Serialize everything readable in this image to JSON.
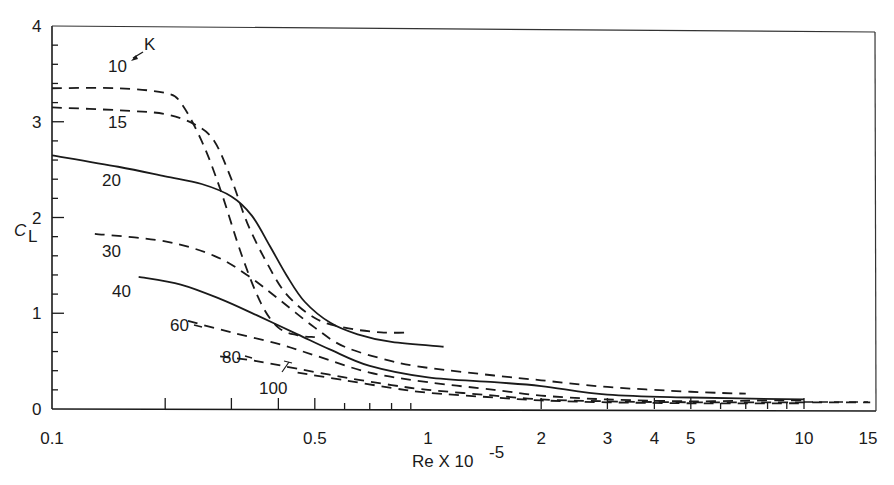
{
  "chart_data": {
    "type": "line",
    "title": "",
    "xlabel": "Re X 10",
    "xlabel_exponent": "-5",
    "ylabel": "C",
    "ylabel_subscript": "L",
    "x_scale": "log",
    "xlim": [
      0.1,
      15
    ],
    "ylim": [
      0,
      4
    ],
    "grid": false,
    "x_ticks": [
      0.1,
      0.5,
      1,
      2,
      3,
      4,
      5,
      10,
      15
    ],
    "x_tick_labels": [
      "0.1",
      "0.5",
      "1",
      "2",
      "3",
      "4",
      "5",
      "10",
      "15"
    ],
    "y_ticks": [
      0,
      1,
      2,
      3,
      4
    ],
    "y_tick_labels": [
      "0",
      "1",
      "2",
      "3",
      "4"
    ],
    "legend_title": "K",
    "series": [
      {
        "name": "10",
        "style": "dashed",
        "x": [
          0.1,
          0.15,
          0.2,
          0.22,
          0.25,
          0.28,
          0.32,
          0.36,
          0.4,
          0.45,
          0.5
        ],
        "y": [
          3.35,
          3.35,
          3.3,
          3.2,
          2.8,
          2.3,
          1.6,
          1.1,
          0.85,
          0.77,
          0.75
        ]
      },
      {
        "name": "15",
        "style": "dashed",
        "x": [
          0.1,
          0.15,
          0.2,
          0.24,
          0.27,
          0.3,
          0.33,
          0.37,
          0.42,
          0.5,
          0.6,
          0.75,
          0.9
        ],
        "y": [
          3.15,
          3.12,
          3.08,
          2.97,
          2.8,
          2.4,
          1.95,
          1.55,
          1.2,
          0.95,
          0.85,
          0.8,
          0.8
        ]
      },
      {
        "name": "20",
        "style": "solid",
        "x": [
          0.1,
          0.15,
          0.2,
          0.25,
          0.3,
          0.34,
          0.38,
          0.42,
          0.47,
          0.55,
          0.65,
          0.8,
          1.1
        ],
        "y": [
          2.65,
          2.53,
          2.43,
          2.35,
          2.22,
          2.02,
          1.7,
          1.4,
          1.12,
          0.9,
          0.78,
          0.7,
          0.65
        ]
      },
      {
        "name": "30",
        "style": "dashed",
        "x": [
          0.13,
          0.2,
          0.27,
          0.33,
          0.4,
          0.5,
          0.6,
          0.8,
          1.0,
          1.5,
          2.0,
          3.0,
          5.0,
          7.0
        ],
        "y": [
          1.83,
          1.75,
          1.6,
          1.4,
          1.15,
          0.85,
          0.65,
          0.5,
          0.43,
          0.35,
          0.3,
          0.23,
          0.18,
          0.16
        ]
      },
      {
        "name": "40",
        "style": "solid",
        "x": [
          0.17,
          0.22,
          0.28,
          0.35,
          0.45,
          0.55,
          0.7,
          1.0,
          1.5,
          2.0,
          3.0,
          5.0,
          10.0
        ],
        "y": [
          1.38,
          1.3,
          1.15,
          0.98,
          0.78,
          0.62,
          0.45,
          0.33,
          0.28,
          0.24,
          0.15,
          0.12,
          0.1
        ]
      },
      {
        "name": "60",
        "style": "dashed",
        "x": [
          0.23,
          0.3,
          0.4,
          0.5,
          0.7,
          1.0,
          1.5,
          2.0,
          3.0,
          5.0,
          8.0,
          10.0
        ],
        "y": [
          0.92,
          0.8,
          0.68,
          0.56,
          0.38,
          0.28,
          0.2,
          0.14,
          0.1,
          0.08,
          0.09,
          0.09
        ]
      },
      {
        "name": "80",
        "style": "dashed",
        "x": [
          0.28,
          0.35,
          0.45,
          0.6,
          0.8,
          1.0,
          1.5,
          2.0,
          3.0,
          5.0,
          10.0,
          15.0
        ],
        "y": [
          0.55,
          0.5,
          0.42,
          0.33,
          0.25,
          0.2,
          0.14,
          0.1,
          0.08,
          0.07,
          0.07,
          0.07
        ]
      },
      {
        "name": "100",
        "style": "dashed",
        "x": [
          0.45,
          0.6,
          0.8,
          1.0,
          1.5,
          2.0,
          3.0,
          5.0,
          10.0
        ],
        "y": [
          0.38,
          0.3,
          0.22,
          0.17,
          0.12,
          0.09,
          0.07,
          0.06,
          0.06
        ]
      }
    ],
    "annotations": [
      {
        "text": "K",
        "arrow_to_label": "10"
      },
      {
        "text": "10"
      },
      {
        "text": "15"
      },
      {
        "text": "20"
      },
      {
        "text": "30"
      },
      {
        "text": "40"
      },
      {
        "text": "60"
      },
      {
        "text": "80"
      },
      {
        "text": "100"
      }
    ]
  },
  "labels": {
    "k_marker": "K",
    "curve_labels": [
      {
        "text": "10",
        "x": 108,
        "y": 72
      },
      {
        "text": "15",
        "x": 108,
        "y": 128
      },
      {
        "text": "20",
        "x": 102,
        "y": 186
      },
      {
        "text": "30",
        "x": 102,
        "y": 257
      },
      {
        "text": "40",
        "x": 112,
        "y": 297
      },
      {
        "text": "60",
        "x": 170,
        "y": 331
      },
      {
        "text": "80",
        "x": 222,
        "y": 363
      },
      {
        "text": "100",
        "x": 259,
        "y": 394
      }
    ]
  }
}
